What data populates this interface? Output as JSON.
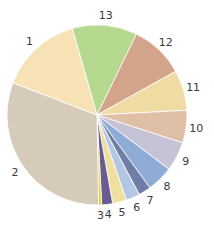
{
  "chart_data": {
    "type": "pie",
    "title": "",
    "start_angle_deg": -16,
    "direction": "clockwise",
    "center": [
      97,
      115
    ],
    "radius": 90,
    "slices": [
      {
        "label": "13",
        "value": 42,
        "color": "#b5d98f"
      },
      {
        "label": "12",
        "value": 35,
        "color": "#d4a48a"
      },
      {
        "label": "11",
        "value": 26,
        "color": "#efdca4"
      },
      {
        "label": "10",
        "value": 21,
        "color": "#dfbfa5"
      },
      {
        "label": "9",
        "value": 19,
        "color": "#c7c3d6"
      },
      {
        "label": "8",
        "value": 17,
        "color": "#8facd6"
      },
      {
        "label": "7",
        "value": 8,
        "color": "#6f7ea8"
      },
      {
        "label": "6",
        "value": 9,
        "color": "#b2c7e3"
      },
      {
        "label": "5",
        "value": 9,
        "color": "#f0df9e"
      },
      {
        "label": "4",
        "value": 7,
        "color": "#6a5b93"
      },
      {
        "label": "3",
        "value": 2,
        "color": "#e2d23a"
      },
      {
        "label": "2",
        "value": 112,
        "color": "#d6cbbb"
      },
      {
        "label": "1",
        "value": 53,
        "color": "#f6e2b4"
      }
    ],
    "legend": "none",
    "labels_outside": true
  }
}
